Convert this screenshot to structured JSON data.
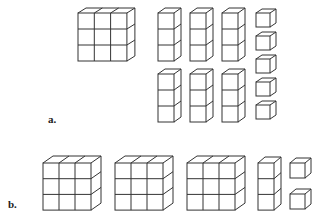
{
  "figure": {
    "part_a": {
      "label": "a.",
      "description": "1 flat (3x3), 6 rods (3x1), 5 unit cubes",
      "flats": 1,
      "rods": 6,
      "units": 5
    },
    "part_b": {
      "label": "b.",
      "description": "3 flats (3x3), 1 rod (3x1), 2 unit cubes",
      "flats": 3,
      "rods": 1,
      "units": 2
    },
    "line_color": "#333333",
    "background": "#ffffff"
  }
}
